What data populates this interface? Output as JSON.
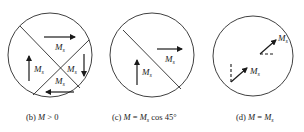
{
  "panels": [
    {
      "id": "b",
      "caption_prefix": "(b) ",
      "caption_var": "M",
      "caption_rest": " > 0",
      "caption_full": "(b) M > 0",
      "labels": [
        "M",
        "M",
        "M",
        "M"
      ],
      "subscript": "s"
    },
    {
      "id": "c",
      "caption_full": "(c) M = Ms cos 45°",
      "caption_prefix": "(c) ",
      "caption_var": "M",
      "caption_mid": " = ",
      "caption_var2": "M",
      "caption_sub": "s",
      "caption_rest": " cos 45°",
      "labels": [
        "M",
        "M"
      ],
      "subscript": "s"
    },
    {
      "id": "d",
      "caption_full": "(d) M = Ms",
      "caption_prefix": "(d) ",
      "caption_var": "M",
      "caption_mid": " = ",
      "caption_var2": "M",
      "caption_sub": "s",
      "labels": [
        "M",
        "M"
      ],
      "subscript": "s"
    }
  ]
}
